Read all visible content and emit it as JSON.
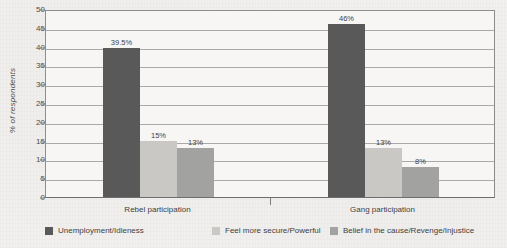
{
  "chart_data": {
    "type": "bar",
    "title": "",
    "subtitle": "",
    "xlabel": "",
    "ylabel": "% of respondents",
    "ylim": [
      0,
      50
    ],
    "ytick_step": 5,
    "yticks": [
      "0",
      "5",
      "10",
      "15",
      "20",
      "25",
      "30",
      "35",
      "40",
      "45",
      "50"
    ],
    "grid": true,
    "legend_position": "bottom",
    "categories": [
      "Rebel participation",
      "Gang participation"
    ],
    "series": [
      {
        "name": "Unemployment/Idleness",
        "color": "#595959",
        "values": [
          39.5,
          46
        ],
        "labels": [
          "39.5%",
          "46%"
        ]
      },
      {
        "name": "Feel more secure/Powerful",
        "color": "#c9c8c4",
        "values": [
          15,
          13
        ],
        "labels": [
          "15%",
          "13%"
        ]
      },
      {
        "name": "Belief in the cause/Revenge/Injustice",
        "color": "#a2a2a0",
        "values": [
          13,
          8
        ],
        "labels": [
          "13%",
          "8%"
        ]
      }
    ]
  },
  "colors": {
    "background": "#f2f1ef",
    "plot_background": "#f7f6f4",
    "gridline": "#a9a9a9",
    "axis": "#8d8d8d",
    "text": "#3f3f3f"
  }
}
